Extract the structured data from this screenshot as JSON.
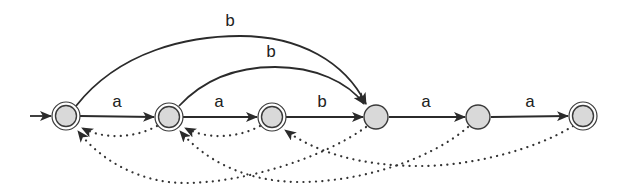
{
  "diagram": {
    "type": "automaton",
    "start_state": "q0",
    "states": [
      {
        "id": "q0",
        "x": 66,
        "y": 116,
        "accepting": true
      },
      {
        "id": "q1",
        "x": 169,
        "y": 117,
        "accepting": true
      },
      {
        "id": "q2",
        "x": 272,
        "y": 117,
        "accepting": true
      },
      {
        "id": "q3",
        "x": 376,
        "y": 117,
        "accepting": false
      },
      {
        "id": "q4",
        "x": 478,
        "y": 117,
        "accepting": false
      },
      {
        "id": "q5",
        "x": 583,
        "y": 116,
        "accepting": true
      }
    ],
    "transitions": [
      {
        "from": "q0",
        "to": "q1",
        "label": "a",
        "style": "solid"
      },
      {
        "from": "q1",
        "to": "q2",
        "label": "a",
        "style": "solid"
      },
      {
        "from": "q2",
        "to": "q3",
        "label": "b",
        "style": "solid"
      },
      {
        "from": "q3",
        "to": "q4",
        "label": "a",
        "style": "solid"
      },
      {
        "from": "q4",
        "to": "q5",
        "label": "a",
        "style": "solid"
      },
      {
        "from": "q0",
        "to": "q3",
        "label": "b",
        "style": "solid-arc-outer"
      },
      {
        "from": "q1",
        "to": "q3",
        "label": "b",
        "style": "solid-arc-inner"
      }
    ],
    "failure_links": [
      {
        "from": "q1",
        "to": "q0",
        "style": "dotted"
      },
      {
        "from": "q2",
        "to": "q1",
        "style": "dotted"
      },
      {
        "from": "q3",
        "to": "q0",
        "style": "dotted"
      },
      {
        "from": "q4",
        "to": "q1",
        "style": "dotted"
      },
      {
        "from": "q5",
        "to": "q2",
        "style": "dotted"
      }
    ],
    "labels": {
      "t01": "a",
      "t12": "a",
      "t23": "b",
      "t34": "a",
      "t45": "a",
      "arc_outer": "b",
      "arc_inner": "b"
    },
    "colors": {
      "node_fill": "#d9d9d9",
      "stroke": "#2b2b2b",
      "background": "#ffffff"
    }
  }
}
